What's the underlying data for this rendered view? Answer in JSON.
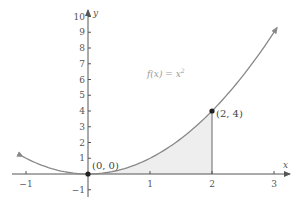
{
  "chart_data": {
    "type": "line",
    "title": "",
    "function_label": "f(x) = x²",
    "function_label_parts": {
      "prefix": "f(x) = x",
      "exponent": "2"
    },
    "xlabel": "x",
    "ylabel": "y",
    "xlim": [
      -1.05,
      3.05
    ],
    "ylim": [
      -1.3,
      10.5
    ],
    "x_ticks": [
      -1,
      1,
      2,
      3
    ],
    "x_tick_labels": [
      "−1",
      "1",
      "2",
      "3"
    ],
    "y_ticks": [
      -1,
      1,
      2,
      3,
      4,
      5,
      6,
      7,
      8,
      9,
      10
    ],
    "y_tick_labels": [
      "−1",
      "1",
      "2",
      "3",
      "4",
      "5",
      "6",
      "7",
      "8",
      "9",
      "10"
    ],
    "grid": false,
    "legend": null,
    "series": [
      {
        "name": "f(x) = x²",
        "x": [
          -1.05,
          -1,
          -0.5,
          0,
          0.5,
          1,
          1.5,
          2,
          2.5,
          3,
          3.05
        ],
        "y": [
          1.1025,
          1,
          0.25,
          0,
          0.25,
          1,
          2.25,
          4,
          6.25,
          9,
          9.3025
        ],
        "color": "#888888",
        "arrows": "both"
      }
    ],
    "shaded_region": {
      "from_x": 0,
      "to_x": 2,
      "under": "f(x) = x²",
      "color": "#eeeeee"
    },
    "points": [
      {
        "x": 0,
        "y": 0,
        "label": "(0, 0)"
      },
      {
        "x": 2,
        "y": 4,
        "label": "(2, 4)"
      }
    ],
    "vertical_line": {
      "x": 2,
      "from_y": 0,
      "to_y": 4
    }
  },
  "colors": {
    "axis": "#555555",
    "curve": "#888888",
    "shade": "#eeeeee",
    "point": "#222222"
  }
}
